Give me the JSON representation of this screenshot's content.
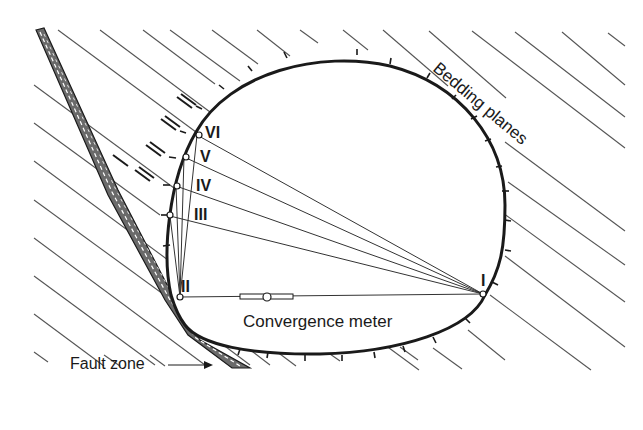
{
  "diagram": {
    "labels": {
      "bedding_planes": "Bedding planes",
      "fault_zone": "Fault zone",
      "convergence_meter": "Convergence meter"
    },
    "measurement_points": [
      {
        "id": "I",
        "label": "I"
      },
      {
        "id": "II",
        "label": "II"
      },
      {
        "id": "III",
        "label": "III"
      },
      {
        "id": "IV",
        "label": "IV"
      },
      {
        "id": "V",
        "label": "V"
      },
      {
        "id": "VI",
        "label": "VI"
      }
    ],
    "colors": {
      "line": "#1a1a1a",
      "hatch": "#555555",
      "background": "#ffffff"
    }
  }
}
